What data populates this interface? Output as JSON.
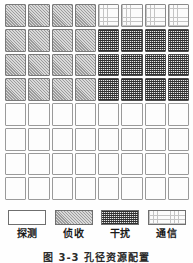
{
  "figure": {
    "caption": "图 3-3  孔径资源配置"
  },
  "grid": {
    "rows": 8,
    "cols": 8,
    "legend_key": {
      "blank": "探测",
      "hatch": "侦收",
      "dark": "干扰",
      "dots": "通信"
    },
    "cells": [
      [
        "hatch",
        "hatch",
        "hatch",
        "hatch",
        "dots",
        "dots",
        "dots",
        "dots"
      ],
      [
        "hatch",
        "hatch",
        "hatch",
        "hatch",
        "dark",
        "dark",
        "dark",
        "dark"
      ],
      [
        "hatch",
        "hatch",
        "hatch",
        "hatch",
        "dark",
        "dark",
        "dark",
        "dark"
      ],
      [
        "hatch",
        "hatch",
        "hatch",
        "hatch",
        "dark",
        "dark",
        "dark",
        "dark"
      ],
      [
        "blank",
        "blank",
        "blank",
        "blank",
        "blank",
        "blank",
        "blank",
        "blank"
      ],
      [
        "blank",
        "blank",
        "blank",
        "blank",
        "blank",
        "blank",
        "blank",
        "blank"
      ],
      [
        "blank",
        "blank",
        "blank",
        "blank",
        "blank",
        "blank",
        "blank",
        "blank"
      ],
      [
        "blank",
        "blank",
        "blank",
        "blank",
        "blank",
        "blank",
        "blank",
        "blank"
      ]
    ]
  },
  "legend": {
    "items": [
      {
        "pattern": "blank",
        "label": "探测"
      },
      {
        "pattern": "hatch",
        "label": "侦收"
      },
      {
        "pattern": "dark",
        "label": "干扰"
      },
      {
        "pattern": "dots",
        "label": "通信"
      }
    ]
  },
  "colors": {
    "cell_border": "#8c8c8c",
    "hatch_fill": "#d9d9d9",
    "hatch_line": "#9c9c9c",
    "dark_fill": "#5d5d5d",
    "dark_line": "#2f2f2f",
    "dots_fill": "#fbfbfb",
    "dots_line": "#c4c4c4",
    "blank_fill": "#ffffff",
    "text": "#1a1a1a",
    "page_background": "#fefefe"
  }
}
